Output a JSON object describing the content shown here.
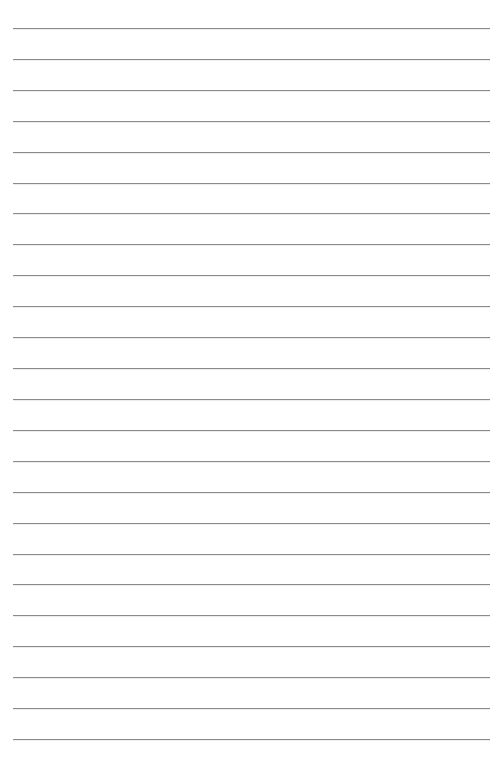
{
  "document": {
    "type": "lined-paper",
    "rule_count": 24,
    "rule_color": "#8a8a8a",
    "background_color": "#ffffff",
    "text_lines": []
  }
}
